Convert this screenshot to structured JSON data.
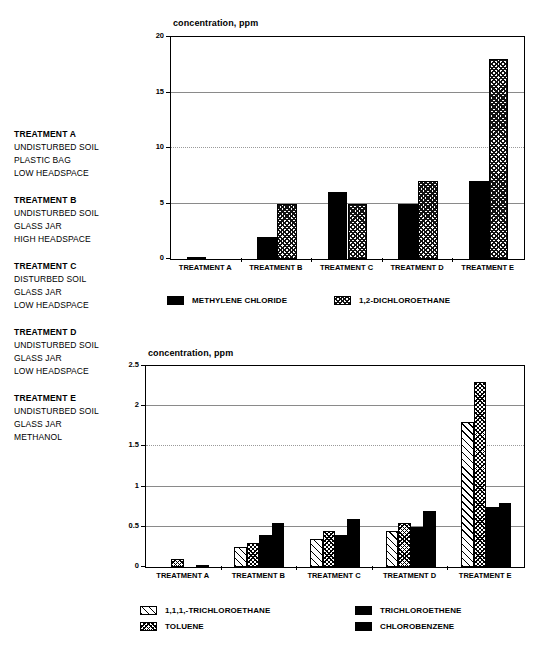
{
  "treatment_key": [
    {
      "title": "TREATMENT A",
      "lines": [
        "UNDISTURBED SOIL",
        "PLASTIC BAG",
        "LOW HEADSPACE"
      ]
    },
    {
      "title": "TREATMENT B",
      "lines": [
        "UNDISTURBED SOIL",
        "GLASS JAR",
        "HIGH HEADSPACE"
      ]
    },
    {
      "title": "TREATMENT C",
      "lines": [
        "DISTURBED SOIL",
        "GLASS JAR",
        "LOW HEADSPACE"
      ]
    },
    {
      "title": "TREATMENT D",
      "lines": [
        "UNDISTURBED SOIL",
        "GLASS JAR",
        "LOW HEADSPACE"
      ]
    },
    {
      "title": "TREATMENT E",
      "lines": [
        "UNDISTURBED SOIL",
        "GLASS JAR",
        "METHANOL"
      ]
    }
  ],
  "chart_data": [
    {
      "id": "top",
      "type": "bar",
      "title": "concentration, ppm",
      "xlabel": "",
      "ylabel": "concentration, ppm",
      "ylim": [
        0,
        20
      ],
      "yticks": [
        "0",
        "5",
        "10",
        "15",
        "20"
      ],
      "ytick_values": [
        0,
        5,
        10,
        15,
        20
      ],
      "grid": true,
      "legend_position": "bottom",
      "categories": [
        "TREATMENT A",
        "TREATMENT B",
        "TREATMENT C",
        "TREATMENT D",
        "TREATMENT E"
      ],
      "series": [
        {
          "name": "METHYLENE CHLORIDE",
          "pattern": "solid",
          "values": [
            0.1,
            2,
            6,
            5,
            7
          ]
        },
        {
          "name": "1,2-DICHLOROETHANE",
          "pattern": "diag-dense",
          "values": [
            0,
            5,
            5,
            7,
            18
          ]
        }
      ]
    },
    {
      "id": "bottom",
      "type": "bar",
      "title": "concentration, ppm",
      "xlabel": "",
      "ylabel": "concentration, ppm",
      "ylim": [
        0,
        2.5
      ],
      "yticks": [
        "0",
        "0.5",
        "1",
        "1.5",
        "2",
        "2.5"
      ],
      "ytick_values": [
        0,
        0.5,
        1,
        1.5,
        2,
        2.5
      ],
      "grid": true,
      "legend_position": "bottom",
      "categories": [
        "TREATMENT A",
        "TREATMENT B",
        "TREATMENT C",
        "TREATMENT D",
        "TREATMENT E"
      ],
      "series": [
        {
          "name": "1,1,1,-TRICHLOROETHANE",
          "pattern": "diag-open",
          "values": [
            0,
            0.25,
            0.35,
            0.45,
            1.8
          ]
        },
        {
          "name": "TOLUENE",
          "pattern": "crosshatch-dense",
          "values": [
            0.1,
            0.3,
            0.45,
            0.55,
            2.3
          ]
        },
        {
          "name": "TRICHLOROETHENE",
          "pattern": "solid",
          "values": [
            0,
            0.4,
            0.4,
            0.5,
            0.75
          ]
        },
        {
          "name": "CHLOROBENZENE",
          "pattern": "solid",
          "values": [
            0.01,
            0.55,
            0.6,
            0.7,
            0.8
          ]
        }
      ]
    }
  ]
}
